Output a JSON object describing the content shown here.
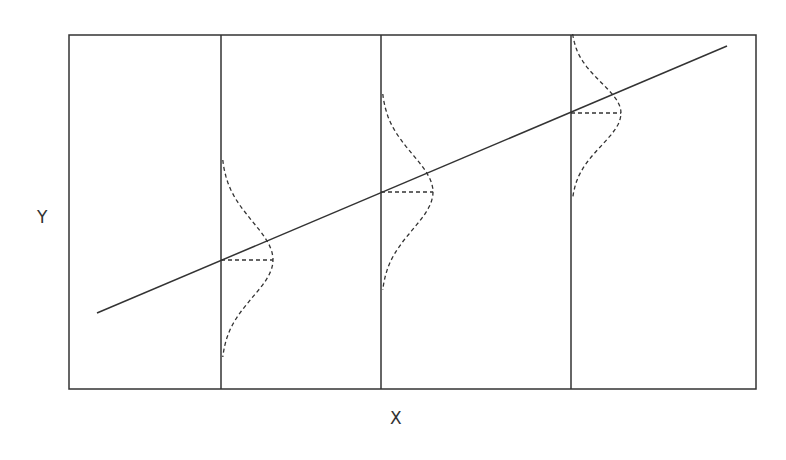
{
  "diagram": {
    "type": "regression-conditional-distributions",
    "x_axis_label": "X",
    "y_axis_label": "Y",
    "colors": {
      "stroke": "#333333",
      "background": "#ffffff"
    },
    "frame": {
      "x1": 69,
      "y1": 35,
      "x2": 756,
      "y2": 389
    },
    "regression_line": {
      "x1": 97,
      "y1": 313,
      "x2": 727,
      "y2": 46
    },
    "conditional_distributions": [
      {
        "x": 221,
        "mean_y": 260,
        "top_y": 160,
        "bottom_y": 357,
        "peak_offset": 52
      },
      {
        "x": 381,
        "mean_y": 192,
        "top_y": 94,
        "bottom_y": 290,
        "peak_offset": 52
      },
      {
        "x": 571,
        "mean_y": 113,
        "top_y": 34,
        "bottom_y": 198,
        "peak_offset": 50
      }
    ]
  }
}
